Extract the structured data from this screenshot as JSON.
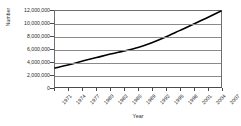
{
  "chart_data": {
    "type": "line",
    "title": "",
    "xlabel": "Year",
    "ylabel": "Number",
    "ylim": [
      0,
      12000000
    ],
    "xlim": [
      1971,
      2007
    ],
    "grid": true,
    "legend": false,
    "y_ticks": [
      0,
      2000000,
      4000000,
      6000000,
      8000000,
      10000000,
      12000000
    ],
    "y_tick_labels": [
      "0",
      "2,000,000",
      "4,000,000",
      "6,000,000",
      "8,000,000",
      "10,000,000",
      "12,000,000"
    ],
    "x_ticks": [
      1971,
      1974,
      1977,
      1980,
      1983,
      1986,
      1989,
      1992,
      1995,
      1998,
      2001,
      2004,
      2007
    ],
    "x_tick_labels": [
      "1971",
      "1974",
      "1977",
      "1980",
      "1983",
      "1986",
      "1989",
      "1992",
      "1995",
      "1998",
      "2001",
      "2004",
      "2007"
    ],
    "series": [
      {
        "name": "Number",
        "color": "#000000",
        "x": [
          1971,
          1974,
          1977,
          1980,
          1983,
          1986,
          1989,
          1992,
          1995,
          1998,
          2001,
          2004,
          2007
        ],
        "values": [
          3000000,
          3500000,
          4100000,
          4650000,
          5200000,
          5700000,
          6250000,
          7000000,
          7900000,
          8900000,
          9900000,
          10950000,
          12000000
        ]
      }
    ]
  }
}
